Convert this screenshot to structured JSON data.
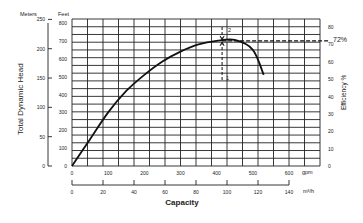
{
  "chart_data": {
    "type": "line",
    "title": "",
    "xlabel": "Capacity",
    "ylabel_left": "Total Dynamic Head",
    "ylabel_right": "Efficiency %",
    "x_units_primary": "gpm",
    "x_units_secondary": "m³/h",
    "y_units_feet": "Feet",
    "y_units_meters": "Meters",
    "x_ticks_gpm": [
      "0",
      "100",
      "200",
      "300",
      "400",
      "500",
      "600"
    ],
    "x_ticks_m3h": [
      "0",
      "20",
      "40",
      "60",
      "80",
      "100",
      "120",
      "140"
    ],
    "y_ticks_feet": [
      "0",
      "100",
      "200",
      "300",
      "400",
      "500",
      "600",
      "700",
      "800"
    ],
    "y_ticks_meters": [
      "0",
      "50",
      "100",
      "150",
      "200",
      "250"
    ],
    "y_ticks_efficiency": [
      "0",
      "10",
      "20",
      "30",
      "40",
      "50",
      "60",
      "70",
      "80"
    ],
    "xlim_gpm": [
      0,
      680
    ],
    "ylim_feet": [
      0,
      800
    ],
    "grid": true,
    "series": [
      {
        "name": "Head curve",
        "x": [
          0,
          50,
          100,
          150,
          200,
          250,
          300,
          350,
          400,
          450,
          500,
          530
        ],
        "y": [
          0,
          150,
          300,
          420,
          510,
          585,
          640,
          680,
          700,
          705,
          650,
          510
        ]
      }
    ],
    "annotations": [
      {
        "type": "hline_dashed",
        "label": "72%",
        "efficiency": 72
      },
      {
        "type": "vline_dashed",
        "x_gpm": 415,
        "markers": [
          "1",
          "2"
        ]
      }
    ]
  },
  "labels": {
    "meters": "Meters",
    "feet": "Feet",
    "left_axis": "Total Dynamic Head",
    "right_axis": "Efficiency %",
    "x_axis": "Capacity",
    "gpm": "gpm",
    "m3h": "m³/h",
    "eff_72": "72%",
    "marker_1": "1",
    "marker_2": "2"
  }
}
